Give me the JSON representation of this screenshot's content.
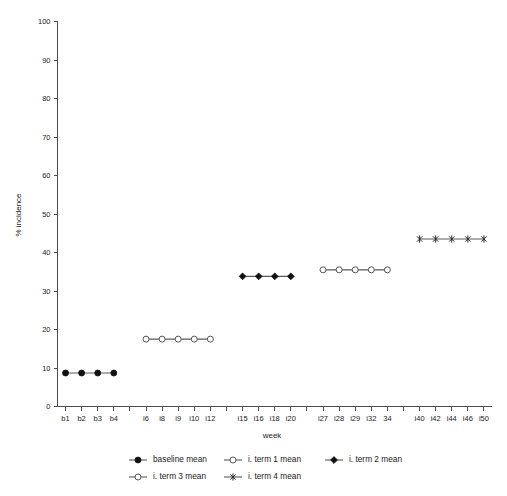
{
  "chart_data": {
    "type": "line",
    "title": "",
    "xlabel": "week",
    "ylabel": "% incidence",
    "ylim": [
      0,
      100
    ],
    "ytick_step": 10,
    "grid": false,
    "legend_position": "bottom",
    "yticks": [
      "0",
      "10",
      "20",
      "30",
      "40",
      "50",
      "60",
      "70",
      "80",
      "90",
      "100"
    ],
    "categories": [
      "b1",
      "b2",
      "b3",
      "b4",
      "",
      "i6",
      "i8",
      "i9",
      "i10",
      "i12",
      "",
      "i15",
      "i16",
      "i18",
      "i20",
      "",
      "i27",
      "i28",
      "i29",
      "i32",
      "34",
      "",
      "i40",
      "i42",
      "i44",
      "i46",
      "i50"
    ],
    "series": [
      {
        "name": "baseline mean",
        "marker": "filled-circle",
        "x": [
          "b1",
          "b2",
          "b3",
          "b4"
        ],
        "values": [
          8.7,
          8.7,
          8.7,
          8.7
        ]
      },
      {
        "name": "i. term 1 mean",
        "marker": "open-circle",
        "x": [
          "i6",
          "i8",
          "i9",
          "i10",
          "i12"
        ],
        "values": [
          17.5,
          17.5,
          17.5,
          17.5,
          17.5
        ]
      },
      {
        "name": "i. term 2 mean",
        "marker": "filled-diamond",
        "x": [
          "i15",
          "i16",
          "i18",
          "i20"
        ],
        "values": [
          33.8,
          33.8,
          33.8,
          33.8
        ]
      },
      {
        "name": "i. term 3 mean",
        "marker": "open-circle",
        "x": [
          "i27",
          "i28",
          "i29",
          "i32",
          "34"
        ],
        "values": [
          35.5,
          35.5,
          35.5,
          35.5,
          35.5
        ]
      },
      {
        "name": "i. term 4 mean",
        "marker": "star",
        "x": [
          "i40",
          "i42",
          "i44",
          "i46",
          "i50"
        ],
        "values": [
          43.5,
          43.5,
          43.5,
          43.5,
          43.5
        ]
      }
    ]
  },
  "legend": {
    "entries": [
      {
        "label": "baseline mean",
        "marker": "filled-circle"
      },
      {
        "label": "i. term 1 mean",
        "marker": "open-circle"
      },
      {
        "label": "i. term 2 mean",
        "marker": "filled-diamond"
      },
      {
        "label": "i. term 3 mean",
        "marker": "open-circle"
      },
      {
        "label": "i. term 4 mean",
        "marker": "star"
      }
    ]
  },
  "colors": {
    "axis": "#4d4d4d",
    "line": "#5a5a5a",
    "marker_fill": "#111111",
    "marker_open_fill": "#ffffff",
    "text": "#1a1a1a",
    "background": "#ffffff"
  }
}
